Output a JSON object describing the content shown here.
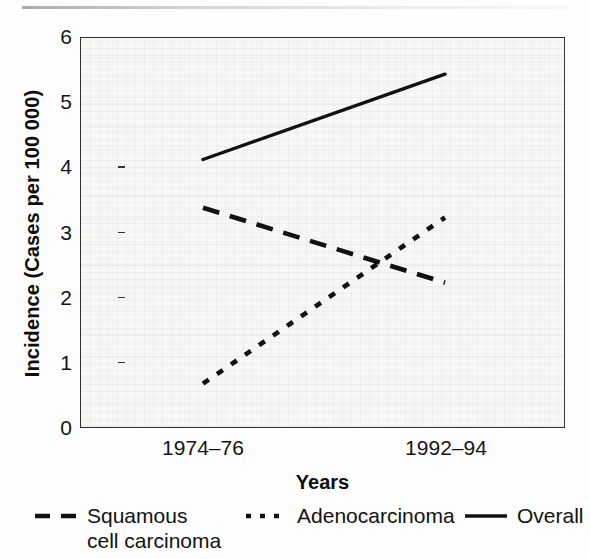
{
  "chart_data": {
    "type": "line",
    "title": "",
    "xlabel": "Years",
    "ylabel": "Incidence (Cases per 100 000)",
    "categories": [
      "1974–76",
      "1992–94"
    ],
    "x": [
      0,
      1
    ],
    "ylim": [
      0,
      6
    ],
    "yticks": [
      0,
      1,
      2,
      3,
      4,
      5,
      6
    ],
    "ytick_labels": [
      "0",
      "1",
      "2",
      "3",
      "4",
      "5",
      "6"
    ],
    "grid": false,
    "legend_position": "below",
    "series": [
      {
        "name": "Squamous\ncell carcinoma",
        "legend_label": "Squamous\ncell carcinoma",
        "style": "dashed",
        "color": "#111111",
        "values": [
          3.38,
          2.23
        ]
      },
      {
        "name": "Adenocarcinoma",
        "legend_label": "Adenocarcinoma",
        "style": "dotted",
        "color": "#111111",
        "values": [
          0.68,
          3.23
        ]
      },
      {
        "name": "Overall",
        "legend_label": "Overall",
        "style": "solid",
        "color": "#111111",
        "values": [
          4.12,
          5.43
        ]
      }
    ]
  },
  "axes": {
    "y_title": "Incidence (Cases per 100 000)",
    "x_title": "Years",
    "y_tick_0": "0",
    "y_tick_1": "1",
    "y_tick_2": "2",
    "y_tick_3": "3",
    "y_tick_4": "4",
    "y_tick_5": "5",
    "y_tick_6": "6",
    "x_tick_0": "1974–76",
    "x_tick_1": "1992–94"
  },
  "legend": {
    "squamous": "Squamous\ncell carcinoma",
    "adeno": "Adenocarcinoma",
    "overall": "Overall"
  },
  "colors": {
    "ink": "#111111",
    "frame": "#333333",
    "plot_background": "#f7f7f6",
    "page_background": "#fdfdfd"
  }
}
